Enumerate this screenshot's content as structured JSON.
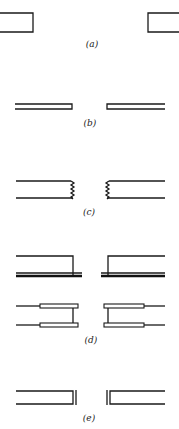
{
  "figure": {
    "ink_color": "#1a1a1a",
    "background": "#ffffff",
    "panels": [
      {
        "id": "a",
        "label": "(a)",
        "variant": "square-open-end"
      },
      {
        "id": "b",
        "label": "(b)",
        "variant": "thin-double-line"
      },
      {
        "id": "c",
        "label": "(c)",
        "variant": "serrated-end"
      },
      {
        "id": "d",
        "label": "(d)",
        "variant": "flanged-and-sleeved"
      },
      {
        "id": "e",
        "label": "(e)",
        "variant": "double-end-wall"
      }
    ]
  }
}
